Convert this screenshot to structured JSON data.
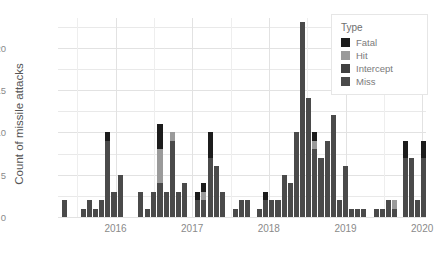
{
  "chart_data": {
    "type": "bar",
    "title": "",
    "subtitle": "",
    "xlabel": "",
    "ylabel": "Count of missile attacks",
    "ylim": [
      0,
      23.5
    ],
    "yticks": [
      0,
      5,
      10,
      15,
      20
    ],
    "xticks": [
      "2016",
      "2017",
      "2018",
      "2019",
      "2020"
    ],
    "xtick_positions": [
      2016,
      2017,
      2018,
      2019,
      2020
    ],
    "xlim": [
      2015.25,
      2020.05
    ],
    "grid": true,
    "stacked": true,
    "legend_title": "Type",
    "legend_position": "top-right",
    "series": [
      {
        "name": "Miss",
        "color": "#4a4a4a"
      },
      {
        "name": "Intercept",
        "color": "#404040"
      },
      {
        "name": "Hit",
        "color": "#9a9a9a"
      },
      {
        "name": "Fatal",
        "color": "#1c1c1c"
      }
    ],
    "categories": [
      "2015-05",
      "2015-06",
      "2015-07",
      "2015-08",
      "2015-09",
      "2015-10",
      "2015-11",
      "2015-12",
      "2016-01",
      "2016-02",
      "2016-03",
      "2016-04",
      "2016-05",
      "2016-06",
      "2016-07",
      "2016-08",
      "2016-09",
      "2016-10",
      "2016-11",
      "2016-12",
      "2017-01",
      "2017-02",
      "2017-03",
      "2017-04",
      "2017-05",
      "2017-06",
      "2017-07",
      "2017-08",
      "2017-09",
      "2017-10",
      "2017-11",
      "2017-12",
      "2018-01",
      "2018-02",
      "2018-03",
      "2018-04",
      "2018-05",
      "2018-06",
      "2018-07",
      "2018-08",
      "2018-09",
      "2018-10",
      "2018-11",
      "2018-12",
      "2019-01",
      "2019-02",
      "2019-03",
      "2019-04",
      "2019-05",
      "2019-06",
      "2019-07",
      "2019-08",
      "2019-09",
      "2019-10",
      "2019-11",
      "2019-12"
    ],
    "bars": [
      {
        "x": 2015.33,
        "total": 2,
        "Miss": 2,
        "Intercept": 0,
        "Hit": 0,
        "Fatal": 0
      },
      {
        "x": 2015.58,
        "total": 1,
        "Miss": 1,
        "Intercept": 0,
        "Hit": 0,
        "Fatal": 0
      },
      {
        "x": 2015.66,
        "total": 2,
        "Miss": 2,
        "Intercept": 0,
        "Hit": 0,
        "Fatal": 0
      },
      {
        "x": 2015.74,
        "total": 1,
        "Miss": 1,
        "Intercept": 0,
        "Hit": 0,
        "Fatal": 0
      },
      {
        "x": 2015.82,
        "total": 2,
        "Miss": 2,
        "Intercept": 0,
        "Hit": 0,
        "Fatal": 0
      },
      {
        "x": 2015.9,
        "total": 10,
        "Miss": 9,
        "Intercept": 0,
        "Hit": 0,
        "Fatal": 1
      },
      {
        "x": 2015.98,
        "total": 3,
        "Miss": 3,
        "Intercept": 0,
        "Hit": 0,
        "Fatal": 0
      },
      {
        "x": 2016.07,
        "total": 5,
        "Miss": 5,
        "Intercept": 0,
        "Hit": 0,
        "Fatal": 0
      },
      {
        "x": 2016.33,
        "total": 3,
        "Miss": 3,
        "Intercept": 0,
        "Hit": 0,
        "Fatal": 0
      },
      {
        "x": 2016.42,
        "total": 1,
        "Miss": 1,
        "Intercept": 0,
        "Hit": 0,
        "Fatal": 0
      },
      {
        "x": 2016.5,
        "total": 3,
        "Miss": 3,
        "Intercept": 0,
        "Hit": 0,
        "Fatal": 0
      },
      {
        "x": 2016.58,
        "total": 11,
        "Miss": 4,
        "Intercept": 0,
        "Hit": 4,
        "Fatal": 3
      },
      {
        "x": 2016.66,
        "total": 3,
        "Miss": 3,
        "Intercept": 0,
        "Hit": 0,
        "Fatal": 0
      },
      {
        "x": 2016.74,
        "total": 10,
        "Miss": 9,
        "Intercept": 0,
        "Hit": 1,
        "Fatal": 0
      },
      {
        "x": 2016.82,
        "total": 3,
        "Miss": 3,
        "Intercept": 0,
        "Hit": 0,
        "Fatal": 0
      },
      {
        "x": 2016.9,
        "total": 4,
        "Miss": 4,
        "Intercept": 0,
        "Hit": 0,
        "Fatal": 0
      },
      {
        "x": 2017.07,
        "total": 3,
        "Miss": 2,
        "Intercept": 0,
        "Hit": 0,
        "Fatal": 1
      },
      {
        "x": 2017.15,
        "total": 4,
        "Miss": 2,
        "Intercept": 0,
        "Hit": 1,
        "Fatal": 1
      },
      {
        "x": 2017.24,
        "total": 10,
        "Miss": 7,
        "Intercept": 0,
        "Hit": 0,
        "Fatal": 3
      },
      {
        "x": 2017.32,
        "total": 6,
        "Miss": 6,
        "Intercept": 0,
        "Hit": 0,
        "Fatal": 0
      },
      {
        "x": 2017.4,
        "total": 3,
        "Miss": 3,
        "Intercept": 0,
        "Hit": 0,
        "Fatal": 0
      },
      {
        "x": 2017.56,
        "total": 1,
        "Miss": 1,
        "Intercept": 0,
        "Hit": 0,
        "Fatal": 0
      },
      {
        "x": 2017.64,
        "total": 2,
        "Miss": 2,
        "Intercept": 0,
        "Hit": 0,
        "Fatal": 0
      },
      {
        "x": 2017.72,
        "total": 2,
        "Miss": 2,
        "Intercept": 0,
        "Hit": 0,
        "Fatal": 0
      },
      {
        "x": 2017.88,
        "total": 1,
        "Miss": 1,
        "Intercept": 0,
        "Hit": 0,
        "Fatal": 0
      },
      {
        "x": 2017.96,
        "total": 3,
        "Miss": 2,
        "Intercept": 0,
        "Hit": 0,
        "Fatal": 1
      },
      {
        "x": 2018.04,
        "total": 2,
        "Miss": 2,
        "Intercept": 0,
        "Hit": 0,
        "Fatal": 0
      },
      {
        "x": 2018.12,
        "total": 2,
        "Miss": 2,
        "Intercept": 0,
        "Hit": 0,
        "Fatal": 0
      },
      {
        "x": 2018.2,
        "total": 5,
        "Miss": 5,
        "Intercept": 0,
        "Hit": 0,
        "Fatal": 0
      },
      {
        "x": 2018.28,
        "total": 4,
        "Miss": 4,
        "Intercept": 0,
        "Hit": 0,
        "Fatal": 0
      },
      {
        "x": 2018.36,
        "total": 10,
        "Miss": 10,
        "Intercept": 0,
        "Hit": 0,
        "Fatal": 0
      },
      {
        "x": 2018.44,
        "total": 23,
        "Miss": 23,
        "Intercept": 0,
        "Hit": 0,
        "Fatal": 0
      },
      {
        "x": 2018.52,
        "total": 14,
        "Miss": 14,
        "Intercept": 0,
        "Hit": 0,
        "Fatal": 0
      },
      {
        "x": 2018.6,
        "total": 10,
        "Miss": 8,
        "Intercept": 0,
        "Hit": 1,
        "Fatal": 1
      },
      {
        "x": 2018.68,
        "total": 7,
        "Miss": 7,
        "Intercept": 0,
        "Hit": 0,
        "Fatal": 0
      },
      {
        "x": 2018.76,
        "total": 9,
        "Miss": 9,
        "Intercept": 0,
        "Hit": 0,
        "Fatal": 0
      },
      {
        "x": 2018.84,
        "total": 12,
        "Miss": 12,
        "Intercept": 0,
        "Hit": 0,
        "Fatal": 0
      },
      {
        "x": 2018.92,
        "total": 2,
        "Miss": 2,
        "Intercept": 0,
        "Hit": 0,
        "Fatal": 0
      },
      {
        "x": 2019.0,
        "total": 6,
        "Miss": 6,
        "Intercept": 0,
        "Hit": 0,
        "Fatal": 0
      },
      {
        "x": 2019.08,
        "total": 1,
        "Miss": 1,
        "Intercept": 0,
        "Hit": 0,
        "Fatal": 0
      },
      {
        "x": 2019.16,
        "total": 1,
        "Miss": 1,
        "Intercept": 0,
        "Hit": 0,
        "Fatal": 0
      },
      {
        "x": 2019.24,
        "total": 1,
        "Miss": 1,
        "Intercept": 0,
        "Hit": 0,
        "Fatal": 0
      },
      {
        "x": 2019.4,
        "total": 1,
        "Miss": 1,
        "Intercept": 0,
        "Hit": 0,
        "Fatal": 0
      },
      {
        "x": 2019.48,
        "total": 1,
        "Miss": 1,
        "Intercept": 0,
        "Hit": 0,
        "Fatal": 0
      },
      {
        "x": 2019.56,
        "total": 2,
        "Miss": 2,
        "Intercept": 0,
        "Hit": 0,
        "Fatal": 0
      },
      {
        "x": 2019.64,
        "total": 2,
        "Miss": 1,
        "Intercept": 0,
        "Hit": 1,
        "Fatal": 0
      },
      {
        "x": 2019.78,
        "total": 9,
        "Miss": 7,
        "Intercept": 0,
        "Hit": 0,
        "Fatal": 2
      },
      {
        "x": 2019.86,
        "total": 7,
        "Miss": 7,
        "Intercept": 0,
        "Hit": 0,
        "Fatal": 0
      },
      {
        "x": 2019.94,
        "total": 2,
        "Miss": 2,
        "Intercept": 0,
        "Hit": 0,
        "Fatal": 0
      },
      {
        "x": 2020.02,
        "total": 9,
        "Miss": 7,
        "Intercept": 0,
        "Hit": 0,
        "Fatal": 2
      }
    ]
  },
  "legend": {
    "title": "Type",
    "items": [
      {
        "label": "Fatal",
        "color": "#1c1c1c"
      },
      {
        "label": "Hit",
        "color": "#9a9a9a"
      },
      {
        "label": "Intercept",
        "color": "#404040"
      },
      {
        "label": "Miss",
        "color": "#4a4a4a"
      }
    ]
  },
  "axes": {
    "y_title": "Count of missile attacks",
    "y_ticks": [
      "0",
      "5",
      "10",
      "15",
      "20"
    ],
    "x_ticks": [
      "2016",
      "2017",
      "2018",
      "2019",
      "2020"
    ]
  }
}
